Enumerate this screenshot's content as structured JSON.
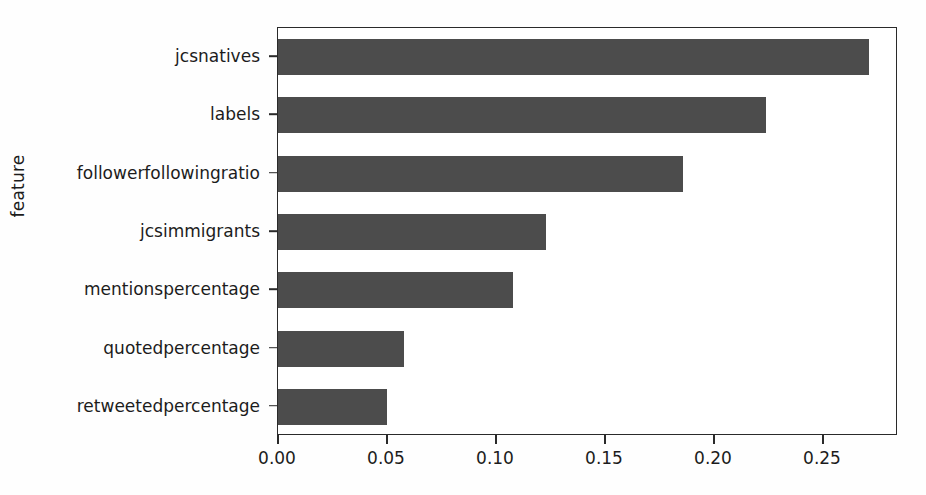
{
  "chart_data": {
    "type": "bar",
    "orientation": "horizontal",
    "title": "",
    "xlabel": "",
    "ylabel": "feature",
    "categories": [
      "jcsnatives",
      "labels",
      "followerfollowingratio",
      "jcsimmigrants",
      "mentionspercentage",
      "quotedpercentage",
      "retweetedpercentage"
    ],
    "values": [
      0.271,
      0.224,
      0.186,
      0.123,
      0.108,
      0.058,
      0.05
    ],
    "xticks": [
      0.0,
      0.05,
      0.1,
      0.15,
      0.2,
      0.25
    ],
    "xticklabels": [
      "0.00",
      "0.05",
      "0.10",
      "0.15",
      "0.20",
      "0.25"
    ],
    "xlim": [
      0.0,
      0.2844
    ],
    "grid": false,
    "legend": null,
    "bar_color": "#4c4c4c",
    "background_color": "#ffffff",
    "axis_color": "#2a2a2a"
  }
}
